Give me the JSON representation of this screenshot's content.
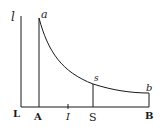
{
  "diagram": {
    "colors": {
      "ink": "#1a1a1a",
      "background": "#ffffff"
    },
    "labels": {
      "l": "l",
      "a": "a",
      "s": "s",
      "b": "b",
      "L": "L",
      "A": "A",
      "I": "I",
      "S": "S",
      "B": "B"
    }
  }
}
